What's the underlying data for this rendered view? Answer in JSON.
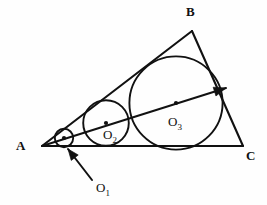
{
  "figure": {
    "kind": "geometry-diagram",
    "background_color": "#fefefe",
    "ink_color": "#111111"
  },
  "labels": {
    "vertex_a": "A",
    "vertex_b": "B",
    "vertex_c": "C",
    "circle_1_name": "O",
    "circle_1_sub": "1",
    "circle_2_name": "O",
    "circle_2_sub": "2",
    "circle_3_name": "O",
    "circle_3_sub": "3"
  },
  "geometry": {
    "vertices": {
      "A": {
        "x": 42,
        "y": 146
      },
      "B": {
        "x": 192,
        "y": 31
      },
      "C": {
        "x": 243,
        "y": 146
      }
    },
    "vertex_label_positions": {
      "A": {
        "x": 16,
        "y": 150
      },
      "B": {
        "x": 186,
        "y": 16
      },
      "C": {
        "x": 246,
        "y": 160
      }
    },
    "circles": [
      {
        "id": "O1",
        "cx": 64,
        "cy": 138,
        "r": 9.2
      },
      {
        "id": "O2",
        "cx": 106,
        "cy": 123,
        "r": 22.8
      },
      {
        "id": "O3",
        "cx": 176,
        "cy": 103,
        "r": 46.6
      }
    ],
    "circle_label_positions": {
      "O1": {
        "x": 96,
        "y": 192
      },
      "O2": {
        "x": 103,
        "y": 139
      },
      "O3": {
        "x": 168,
        "y": 126
      }
    },
    "bisector_ray": {
      "from": {
        "x": 42,
        "y": 146
      },
      "to": {
        "x": 226,
        "y": 88
      },
      "arrowhead_at": {
        "x": 226,
        "y": 88
      }
    },
    "leader_arrow_o1": {
      "from": {
        "x": 92,
        "y": 180
      },
      "to": {
        "x": 68,
        "y": 149
      }
    },
    "center_dots": [
      {
        "x": 64,
        "y": 138
      },
      {
        "x": 106,
        "y": 123
      },
      {
        "x": 176,
        "y": 103
      }
    ]
  }
}
